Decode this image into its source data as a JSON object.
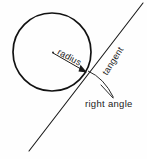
{
  "diagram": {
    "background_color": "#fefefe",
    "stroke_color": "#1a1a1a",
    "labels": {
      "radius": "radius",
      "tangent": "tangent",
      "right_angle": "right angle"
    },
    "shapes": {
      "circle": {
        "name": "circle",
        "center_x": 52,
        "center_y": 52,
        "radius": 39
      },
      "radius_line": {
        "name": "radius-line",
        "x1": 53,
        "y1": 53,
        "x2": 86,
        "y2": 72,
        "arrowhead": true
      },
      "tangent_line": {
        "name": "tangent-line",
        "x1": 29,
        "y1": 151,
        "x2": 143,
        "y2": 3
      },
      "right_angle_arc": {
        "name": "right-angle-arc",
        "start_x": 87,
        "start_y": 70,
        "end_x": 113,
        "end_y": 97
      },
      "leader_line": {
        "name": "leader-line",
        "x1": 101,
        "y1": 85,
        "x2": 113,
        "y2": 98
      },
      "tangent_point": {
        "name": "tangent-point",
        "x": 86,
        "y": 72
      }
    }
  }
}
